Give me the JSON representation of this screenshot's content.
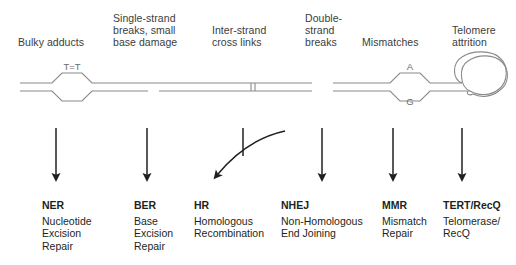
{
  "figure": {
    "stroke_color": "#808080",
    "arrow_color": "#231f20",
    "label_color": "#3c3c3c",
    "text_color": "#231f20"
  },
  "damage_labels": [
    {
      "name": "bulky-adducts",
      "text": "Bulky adducts"
    },
    {
      "name": "single-strand-breaks",
      "text": "Single-strand\nbreaks, small\nbase damage"
    },
    {
      "name": "inter-strand-cross-links",
      "text": "Inter-strand\ncross links"
    },
    {
      "name": "double-strand-breaks",
      "text": "Double-\nstrand\nbreaks"
    },
    {
      "name": "mismatches",
      "text": "Mismatches"
    },
    {
      "name": "telomere-attrition",
      "text": "Telomere\nattrition"
    }
  ],
  "dna_annotations": {
    "thymine_dimer": "T=T",
    "mismatch_top": "A",
    "mismatch_bottom": "G"
  },
  "pathways": [
    {
      "name": "ner",
      "abbr": "NER",
      "full": "Nucleotide\nExcision\nRepair"
    },
    {
      "name": "ber",
      "abbr": "BER",
      "full": "Base\nExcision\nRepair"
    },
    {
      "name": "hr",
      "abbr": "HR",
      "full": "Homologous\nRecombination"
    },
    {
      "name": "nhej",
      "abbr": "NHEJ",
      "full": "Non-Homologous\nEnd Joining"
    },
    {
      "name": "mmr",
      "abbr": "MMR",
      "full": "Mismatch\nRepair"
    },
    {
      "name": "tert",
      "abbr": "TERT/RecQ",
      "full": "Telomerase/\nRecQ"
    }
  ]
}
